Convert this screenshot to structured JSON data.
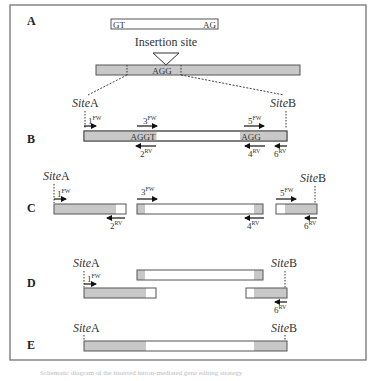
{
  "figure": {
    "panels": [
      {
        "id": "A",
        "label": "A"
      },
      {
        "id": "B",
        "label": "B"
      },
      {
        "id": "C",
        "label": "C"
      },
      {
        "id": "D",
        "label": "D"
      },
      {
        "id": "E",
        "label": "E"
      }
    ],
    "panel_a": {
      "intron_left": "GT",
      "intron_right": "AG",
      "insertion_label": "Insertion site",
      "target_seq": "AGG"
    },
    "panel_b": {
      "seq_left": "AGGT",
      "seq_right": "AGG"
    },
    "sites": {
      "site_word": "Site",
      "a_suffix": "A",
      "b_suffix": "B"
    },
    "primers": {
      "p1": {
        "num": "1",
        "dir": "FW"
      },
      "p2": {
        "num": "2",
        "dir": "RV"
      },
      "p3": {
        "num": "3",
        "dir": "FW"
      },
      "p4": {
        "num": "4",
        "dir": "RV"
      },
      "p5": {
        "num": "5",
        "dir": "FW"
      },
      "p6": {
        "num": "6",
        "dir": "RV"
      }
    },
    "colors": {
      "grey_segment": "#c8c8c8",
      "white_segment": "#ffffff",
      "outline": "#555555",
      "frame": "#666666"
    },
    "caption": "Schematic diagram of the inserted intron-mediated gene editing strategy"
  }
}
